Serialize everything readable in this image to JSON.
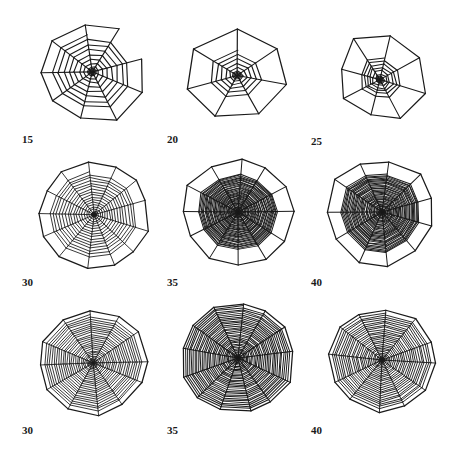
{
  "figure": {
    "page_background": "#ffffff",
    "ink_color": "#1a1a1a",
    "label_color": "#1a1a1a",
    "caption_text": "",
    "rows": 3,
    "columns": 3
  },
  "webs": [
    {
      "label": "15",
      "row": 0,
      "col": 0,
      "cx": 92,
      "cy": 70,
      "radius": 58,
      "radii_count": 9,
      "spiral_turns": 7,
      "spiral_start_radius": 6,
      "spiral_end_radius": 46,
      "hub_radius": 5,
      "frame_irregularity": 0.16,
      "line_width": 1.15,
      "density": "sparse",
      "rotation": -8,
      "squash_x": 1.0,
      "squash_y": 0.94,
      "hub_offset_x": 0,
      "hub_offset_y": 2,
      "jitter": 1.5,
      "frame_gap_sectors": [
        1
      ],
      "seed": 1501
    },
    {
      "label": "20",
      "row": 0,
      "col": 1,
      "cx": 237,
      "cy": 72,
      "radius": 54,
      "radii_count": 7,
      "spiral_turns": 5,
      "spiral_start_radius": 5,
      "spiral_end_radius": 30,
      "hub_radius": 5,
      "frame_irregularity": 0.1,
      "line_width": 1.15,
      "density": "sparse",
      "rotation": -2,
      "squash_x": 1.04,
      "squash_y": 0.86,
      "hub_offset_x": 0,
      "hub_offset_y": 4,
      "jitter": 1.4,
      "frame_gap_sectors": [],
      "seed": 2001
    },
    {
      "label": "25",
      "row": 0,
      "col": 2,
      "cx": 380,
      "cy": 72,
      "radius": 52,
      "radii_count": 8,
      "spiral_turns": 6,
      "spiral_start_radius": 4,
      "spiral_end_radius": 26,
      "hub_radius": 4,
      "frame_irregularity": 0.3,
      "line_width": 1.15,
      "density": "sparse",
      "rotation": 16,
      "squash_x": 0.98,
      "squash_y": 0.92,
      "hub_offset_x": 2,
      "hub_offset_y": 8,
      "jitter": 1.8,
      "frame_gap_sectors": [],
      "seed": 2501
    },
    {
      "label": "30",
      "row": 1,
      "col": 0,
      "cx": 92,
      "cy": 213,
      "radius": 58,
      "radii_count": 13,
      "spiral_turns": 15,
      "spiral_start_radius": 4,
      "spiral_end_radius": 47,
      "hub_radius": 3,
      "frame_irregularity": 0.1,
      "line_width": 0.85,
      "density": "medium",
      "rotation": -6,
      "squash_x": 1.0,
      "squash_y": 0.95,
      "hub_offset_x": 2,
      "hub_offset_y": 2,
      "jitter": 1.1,
      "frame_gap_sectors": [],
      "seed": 3001
    },
    {
      "label": "35",
      "row": 1,
      "col": 1,
      "cx": 238,
      "cy": 212,
      "radius": 58,
      "radii_count": 12,
      "spiral_turns": 34,
      "spiral_start_radius": 3,
      "spiral_end_radius": 42,
      "hub_radius": 3,
      "frame_irregularity": 0.08,
      "line_width": 1.0,
      "density": "dense",
      "rotation": 2,
      "squash_x": 1.0,
      "squash_y": 0.96,
      "hub_offset_x": 0,
      "hub_offset_y": 0,
      "jitter": 1.0,
      "frame_gap_sectors": [],
      "seed": 3501
    },
    {
      "label": "40",
      "row": 1,
      "col": 2,
      "cx": 382,
      "cy": 212,
      "radius": 58,
      "radii_count": 11,
      "spiral_turns": 32,
      "spiral_start_radius": 3,
      "spiral_end_radius": 44,
      "hub_radius": 3,
      "frame_irregularity": 0.12,
      "line_width": 1.0,
      "density": "dense",
      "rotation": 10,
      "squash_x": 1.0,
      "squash_y": 0.96,
      "hub_offset_x": 0,
      "hub_offset_y": 0,
      "jitter": 1.1,
      "frame_gap_sectors": [],
      "seed": 4001
    },
    {
      "label": "30",
      "row": 2,
      "col": 0,
      "cx": 93,
      "cy": 360,
      "radius": 56,
      "radii_count": 12,
      "spiral_turns": 22,
      "spiral_start_radius": 4,
      "spiral_end_radius": 52,
      "hub_radius": 4,
      "frame_irregularity": 0.08,
      "line_width": 0.85,
      "density": "medium",
      "rotation": -4,
      "squash_x": 1.0,
      "squash_y": 0.96,
      "hub_offset_x": 0,
      "hub_offset_y": 3,
      "jitter": 1.0,
      "frame_gap_sectors": [],
      "seed": 3002
    },
    {
      "label": "35",
      "row": 2,
      "col": 1,
      "cx": 238,
      "cy": 358,
      "radius": 58,
      "radii_count": 13,
      "spiral_turns": 30,
      "spiral_start_radius": 3,
      "spiral_end_radius": 56,
      "hub_radius": 3,
      "frame_irregularity": 0.06,
      "line_width": 1.0,
      "density": "dense",
      "rotation": 3,
      "squash_x": 1.0,
      "squash_y": 0.97,
      "hub_offset_x": 0,
      "hub_offset_y": 0,
      "jitter": 1.0,
      "frame_gap_sectors": [],
      "seed": 3502
    },
    {
      "label": "40",
      "row": 2,
      "col": 2,
      "cx": 382,
      "cy": 360,
      "radius": 55,
      "radii_count": 12,
      "spiral_turns": 24,
      "spiral_start_radius": 3,
      "spiral_end_radius": 52,
      "hub_radius": 3,
      "frame_irregularity": 0.07,
      "line_width": 0.9,
      "density": "medium",
      "rotation": 6,
      "squash_x": 1.0,
      "squash_y": 0.96,
      "hub_offset_x": 0,
      "hub_offset_y": 0,
      "jitter": 1.0,
      "frame_gap_sectors": [],
      "seed": 4002
    }
  ],
  "labels": [
    {
      "text": "15",
      "x": 22,
      "y": 134
    },
    {
      "text": "20",
      "x": 167,
      "y": 134
    },
    {
      "text": "25",
      "x": 311,
      "y": 136
    },
    {
      "text": "30",
      "x": 22,
      "y": 277
    },
    {
      "text": "35",
      "x": 167,
      "y": 277
    },
    {
      "text": "40",
      "x": 311,
      "y": 277
    },
    {
      "text": "30",
      "x": 22,
      "y": 425
    },
    {
      "text": "35",
      "x": 167,
      "y": 425
    },
    {
      "text": "40",
      "x": 311,
      "y": 425
    }
  ]
}
